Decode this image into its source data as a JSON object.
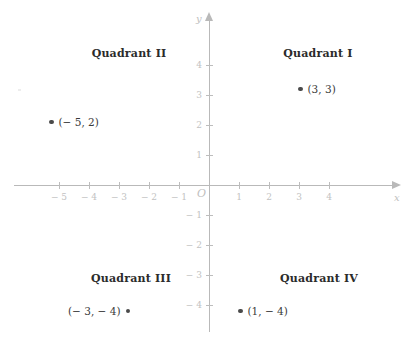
{
  "chart_data": {
    "type": "scatter",
    "title": "",
    "xlabel": "x",
    "ylabel": "y",
    "origin_label": "O",
    "xlim": [
      -5.8,
      5.5
    ],
    "ylim": [
      -4.8,
      4.8
    ],
    "grid": false,
    "legend": "none",
    "x_ticks": [
      -5,
      -4,
      -3,
      -2,
      -1,
      1,
      2,
      3,
      4
    ],
    "y_ticks": [
      4,
      3,
      2,
      1,
      -1,
      -2,
      -3,
      -4
    ],
    "x_tick_labels": [
      "− 5",
      "− 4",
      "− 3",
      "− 2",
      "− 1",
      "1",
      "2",
      "3",
      "4"
    ],
    "y_tick_labels": [
      "4",
      "3",
      "2",
      "1",
      "− 1",
      "− 2",
      "− 3",
      "− 4"
    ],
    "points": [
      {
        "x": 3,
        "y": 3,
        "label": "(3, 3)",
        "label_side": "right",
        "quadrant": "I"
      },
      {
        "x": -5,
        "y": 2,
        "label": "(− 5, 2)",
        "label_side": "right",
        "quadrant": "II"
      },
      {
        "x": -3,
        "y": -4,
        "label": "(− 3, − 4)",
        "label_side": "left",
        "quadrant": "III"
      },
      {
        "x": 1,
        "y": -4,
        "label": "(1, − 4)",
        "label_side": "right",
        "quadrant": "IV"
      }
    ],
    "annotations": [
      {
        "text": "Quadrant I",
        "x": 3.6,
        "y": 4.6
      },
      {
        "text": "Quadrant II",
        "x": -2.7,
        "y": 4.6
      },
      {
        "text": "Quadrant III",
        "x": -2.6,
        "y": -2.9
      },
      {
        "text": "Quadrant IV",
        "x": 3.7,
        "y": -2.9
      }
    ]
  },
  "axes": {
    "x_name": "x",
    "y_name": "y",
    "origin": "O"
  },
  "quadrants": {
    "q1": "Quadrant I",
    "q2": "Quadrant II",
    "q3": "Quadrant III",
    "q4": "Quadrant IV"
  },
  "points": {
    "p1": "(3, 3)",
    "p2": "(− 5, 2)",
    "p3": "(− 3, − 4)",
    "p4": "(1, − 4)"
  },
  "colors": {
    "axis": "#b9b9b9",
    "tick_label": "#c2c2c2",
    "point": "#4a4a4a",
    "quadrant_text": "#2b2b2b",
    "background": "#ffffff"
  }
}
